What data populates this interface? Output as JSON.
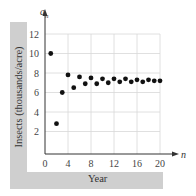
{
  "chart_data": {
    "type": "scatter",
    "title": "",
    "xlabel": "Year",
    "ylabel": "Insects (thousands/acre)",
    "x_axis_symbol": "n",
    "y_axis_symbol": "a_n",
    "xlim": [
      0,
      21
    ],
    "ylim": [
      0,
      13
    ],
    "x_ticks": [
      0,
      4,
      8,
      12,
      16,
      20
    ],
    "y_ticks": [
      2,
      4,
      6,
      8,
      10,
      12
    ],
    "grid": true,
    "legend": null,
    "x": [
      1,
      2,
      3,
      4,
      5,
      6,
      7,
      8,
      9,
      10,
      11,
      12,
      13,
      14,
      15,
      16,
      17,
      18,
      19,
      20
    ],
    "y": [
      10,
      2.8,
      6,
      7.8,
      6.5,
      7.6,
      6.9,
      7.5,
      6.9,
      7.4,
      7.0,
      7.4,
      7.1,
      7.4,
      7.1,
      7.3,
      7.1,
      7.3,
      7.2,
      7.2
    ],
    "colors": {
      "points": "#111111",
      "grid": "#d8d8d8",
      "axis": "#333333",
      "label_band": "#cfcfcf"
    }
  },
  "labels": {
    "x_title": "Year",
    "y_title": "Insects (thousands/acre)",
    "x_symbol": "n",
    "y_symbol_base": "a",
    "y_symbol_sub": "n"
  }
}
